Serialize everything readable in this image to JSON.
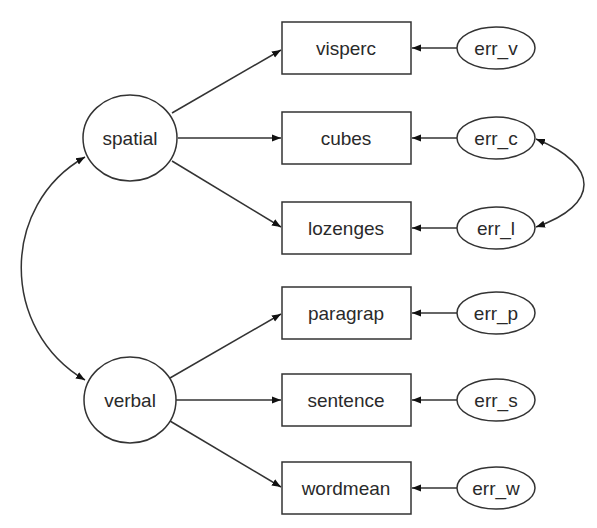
{
  "diagram": {
    "type": "structural-equation-model",
    "latent_factors": [
      {
        "id": "spatial",
        "label": "spatial",
        "cx": 130,
        "cy": 138
      },
      {
        "id": "verbal",
        "label": "verbal",
        "cx": 130,
        "cy": 400
      }
    ],
    "observed_variables": [
      {
        "id": "visperc",
        "label": "visperc",
        "factor": "spatial",
        "cy": 48
      },
      {
        "id": "cubes",
        "label": "cubes",
        "factor": "spatial",
        "cy": 138
      },
      {
        "id": "lozenges",
        "label": "lozenges",
        "factor": "spatial",
        "cy": 228
      },
      {
        "id": "paragrap",
        "label": "paragrap",
        "factor": "verbal",
        "cy": 313
      },
      {
        "id": "sentence",
        "label": "sentence",
        "factor": "verbal",
        "cy": 400
      },
      {
        "id": "wordmean",
        "label": "wordmean",
        "factor": "verbal",
        "cy": 488
      }
    ],
    "error_terms": [
      {
        "id": "err_v",
        "label": "err_v",
        "target": "visperc",
        "cy": 48
      },
      {
        "id": "err_c",
        "label": "err_c",
        "target": "cubes",
        "cy": 138
      },
      {
        "id": "err_l",
        "label": "err_l",
        "target": "lozenges",
        "cy": 228
      },
      {
        "id": "err_p",
        "label": "err_p",
        "target": "paragrap",
        "cy": 313
      },
      {
        "id": "err_s",
        "label": "err_s",
        "target": "sentence",
        "cy": 400
      },
      {
        "id": "err_w",
        "label": "err_w",
        "target": "wordmean",
        "cy": 488
      }
    ],
    "covariances": [
      {
        "from": "spatial",
        "to": "verbal"
      },
      {
        "from": "err_c",
        "to": "err_l"
      }
    ],
    "colors": {
      "stroke": "#333333",
      "text": "#2a2a2a",
      "background": "#ffffff"
    }
  }
}
